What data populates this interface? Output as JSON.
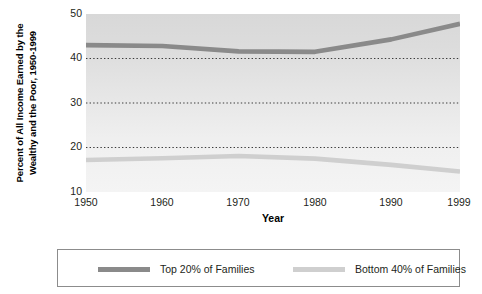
{
  "chart_data": {
    "type": "line",
    "title": "",
    "xlabel": "Year",
    "ylabel": "Percent of All Income Earned by the Wealthy and the Poor, 1950-1999",
    "ylabel_line1": "Percent of All Income Earned by the",
    "ylabel_line2": "Wealthy and the Poor, 1950-1999",
    "x": [
      1950,
      1960,
      1970,
      1980,
      1990,
      1999
    ],
    "xticklabels": [
      "1950",
      "1960",
      "1970",
      "1980",
      "1990",
      "1999"
    ],
    "yticks": [
      50,
      40,
      30,
      20,
      10
    ],
    "yticklabels": [
      "50",
      "40",
      "30",
      "20",
      "10"
    ],
    "xlim": [
      1950,
      1999
    ],
    "ylim": [
      10,
      50
    ],
    "grid": "horizontal-dotted",
    "gridlines": [
      40,
      30,
      20
    ],
    "legend_position": "below-plot",
    "plot_background": "#e4e4e4",
    "series": [
      {
        "name": "Top 20% of Families",
        "color": "#8a8a8a",
        "values": [
          43.0,
          42.8,
          41.6,
          41.5,
          44.3,
          47.8
        ]
      },
      {
        "name": "Bottom 40% of Families",
        "color": "#cfcfcf",
        "values": [
          17.2,
          17.6,
          18.1,
          17.5,
          16.1,
          14.6
        ]
      }
    ]
  },
  "legend": {
    "entries": [
      {
        "label": "Top 20% of Families",
        "color": "#8a8a8a"
      },
      {
        "label": "Bottom 40% of Families",
        "color": "#cfcfcf"
      }
    ]
  },
  "colors": {
    "top_series": "#8a8a8a",
    "bottom_series": "#cfcfcf",
    "grid": "#3a3a3a",
    "text": "#231f20",
    "legend_border": "#8c8c8c",
    "plot_bg": "#e4e4e4"
  }
}
